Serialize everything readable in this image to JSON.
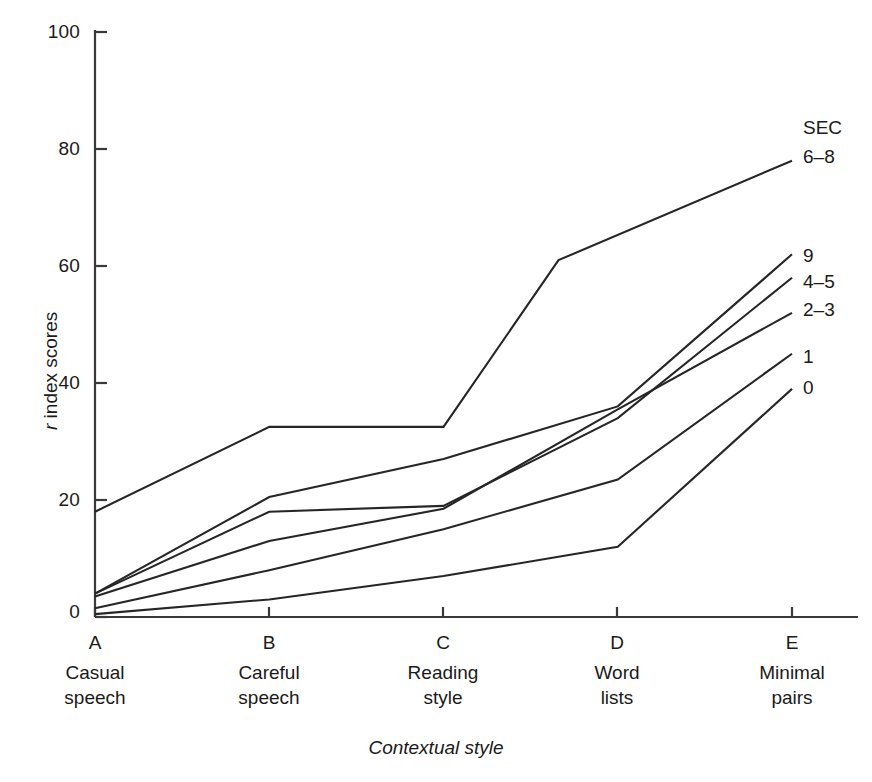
{
  "chart_data": {
    "type": "line",
    "title": "",
    "subtitle": "",
    "xlabel": "Contextual style",
    "ylabel": "r index scores",
    "ylabel_italic_prefix": "r",
    "ylabel_rest": " index scores",
    "xlim": [
      0,
      4
    ],
    "ylim": [
      0,
      100
    ],
    "yticks": [
      0,
      20,
      40,
      60,
      80,
      100
    ],
    "ytick_labels": [
      "0",
      "20",
      "40",
      "60",
      "80",
      "100"
    ],
    "grid": false,
    "legend_position": "right-of-lines (direct line labels)",
    "legend_title": "SEC",
    "categories": [
      "A",
      "B",
      "C",
      "D",
      "E"
    ],
    "category_captions": [
      [
        "Casual",
        "speech"
      ],
      [
        "Careful",
        "speech"
      ],
      [
        "Reading",
        "style"
      ],
      [
        "Word",
        "lists"
      ],
      [
        "Minimal",
        "pairs"
      ]
    ],
    "series": [
      {
        "name": "6-8",
        "label": "6–8",
        "x": [
          0,
          1,
          2,
          2.66,
          4
        ],
        "values": [
          18,
          32.5,
          32.5,
          61,
          78
        ],
        "note": "extra vertex between C and D at r≈61"
      },
      {
        "name": "9",
        "label": "9",
        "x": [
          0,
          1,
          2,
          3,
          4
        ],
        "values": [
          4,
          20.5,
          27,
          36,
          62
        ]
      },
      {
        "name": "4-5",
        "label": "4–5",
        "x": [
          0,
          1,
          2,
          3,
          4
        ],
        "values": [
          4,
          18,
          19,
          34,
          58
        ]
      },
      {
        "name": "2-3",
        "label": "2–3",
        "x": [
          0,
          1,
          2,
          3,
          4
        ],
        "values": [
          3.5,
          13,
          18.5,
          35.5,
          52
        ]
      },
      {
        "name": "1",
        "label": "1",
        "x": [
          0,
          1,
          2,
          3,
          4
        ],
        "values": [
          1.5,
          8,
          15,
          23.5,
          45
        ]
      },
      {
        "name": "0",
        "label": "0",
        "x": [
          0,
          1,
          2,
          3,
          4
        ],
        "values": [
          0.5,
          3,
          7,
          12,
          39
        ]
      }
    ],
    "line_color": "#262626",
    "axis_color": "#3a3a3a"
  }
}
